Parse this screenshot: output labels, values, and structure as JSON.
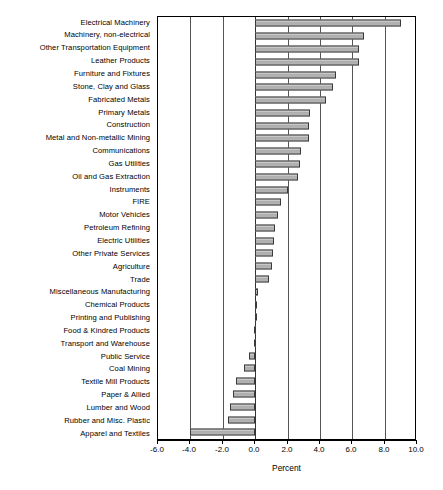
{
  "chart_data": {
    "type": "bar",
    "orientation": "horizontal",
    "title": "",
    "xlabel": "Percent",
    "ylabel": "",
    "xlim": [
      -6.0,
      10.0
    ],
    "xticks": [
      "-6.0",
      "-4.0",
      "-2.0",
      "0.0",
      "2.0",
      "4.0",
      "6.0",
      "8.0",
      "10.0"
    ],
    "xtick_values": [
      -6.0,
      -4.0,
      -2.0,
      0.0,
      2.0,
      4.0,
      6.0,
      8.0,
      10.0
    ],
    "grid": "vertical",
    "legend": "none",
    "bar_color": "#b9b9b9",
    "bar_edge_color": "#3a3a3a",
    "categories": [
      "Electrical Machinery",
      "Machinery, non-electrical",
      "Other Transportation Equipment",
      "Leather Products",
      "Furniture and Fixtures",
      "Stone, Clay and Glass",
      "Fabricated Metals",
      "Primary Metals",
      "Construction",
      "Metal and Non-metallic Mining",
      "Communications",
      "Gas Utilities",
      "Oil and Gas Extraction",
      "Instruments",
      "FIRE",
      "Motor Vehicles",
      "Petroleum Refining",
      "Electric Utilities",
      "Other Private Services",
      "Agriculture",
      "Trade",
      "Miscellaneous Manufacturing",
      "Chemical Products",
      "Printing and Publishing",
      "Food & Kindred Products",
      "Transport and Warehouse",
      "Public Service",
      "Coal Mining",
      "Textile Mill Products",
      "Paper & Allied",
      "Lumber and Wood",
      "Rubber and Misc. Plastic",
      "Apparel and Textiles"
    ],
    "values": [
      9.0,
      6.7,
      6.4,
      6.4,
      5.0,
      4.8,
      4.4,
      3.4,
      3.3,
      3.35,
      2.85,
      2.8,
      2.65,
      2.0,
      1.6,
      1.4,
      1.2,
      1.15,
      1.1,
      1.05,
      0.85,
      0.15,
      0.1,
      0.02,
      -0.05,
      -0.07,
      -0.37,
      -0.68,
      -1.17,
      -1.36,
      -1.54,
      -1.67,
      -4.0
    ]
  }
}
